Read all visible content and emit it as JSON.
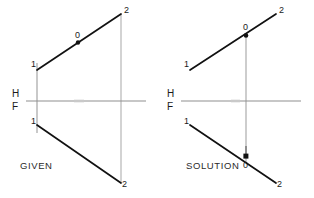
{
  "figure": {
    "background_color": "#ffffff",
    "line_color": "#111111",
    "projector_color": "#b4b4b4",
    "reference_line_color": "#8a8a8a",
    "width": 314,
    "height": 198
  },
  "captions": {
    "given": "GIVEN",
    "solution": "SOLUTION",
    "footer": ""
  },
  "reference_lines": {
    "given": {
      "upper_label": "H",
      "lower_label": "F",
      "y": 101,
      "x_start": 26,
      "x_end": 146
    },
    "solution": {
      "upper_label": "H",
      "lower_label": "F",
      "y": 101,
      "x_start": 181,
      "x_end": 301
    }
  },
  "views": {
    "given": {
      "name": "GIVEN",
      "top_view": {
        "name": "top-view",
        "line": {
          "x1": 37,
          "y1": 70,
          "x2": 121,
          "y2": 14
        },
        "endpoints": [
          {
            "label": "1",
            "x": 37,
            "y": 70
          },
          {
            "label": "2",
            "x": 121,
            "y": 14
          }
        ],
        "points": [
          {
            "label": "0",
            "x": 78,
            "y": 42,
            "marked": true
          }
        ]
      },
      "front_view": {
        "name": "front-view",
        "line": {
          "x1": 37,
          "y1": 125,
          "x2": 121,
          "y2": 183
        },
        "endpoints": [
          {
            "label": "1",
            "x": 37,
            "y": 125
          },
          {
            "label": "2",
            "x": 121,
            "y": 183
          }
        ],
        "points": []
      },
      "projectors": [
        {
          "label": "projector-1",
          "x": 37,
          "y1": 63,
          "y2": 133
        },
        {
          "label": "projector-2",
          "x": 121,
          "y1": 14,
          "y2": 183
        }
      ]
    },
    "solution": {
      "name": "SOLUTION",
      "top_view": {
        "name": "top-view",
        "line": {
          "x1": 190,
          "y1": 70,
          "x2": 276,
          "y2": 14
        },
        "endpoints": [
          {
            "label": "1",
            "x": 190,
            "y": 70
          },
          {
            "label": "2",
            "x": 276,
            "y": 14
          }
        ],
        "points": [
          {
            "label": "0",
            "x": 246,
            "y": 35,
            "marked": true
          }
        ]
      },
      "front_view": {
        "name": "front-view",
        "line": {
          "x1": 190,
          "y1": 125,
          "x2": 276,
          "y2": 183
        },
        "endpoints": [
          {
            "label": "1",
            "x": 190,
            "y": 125
          },
          {
            "label": "2",
            "x": 276,
            "y": 183
          }
        ],
        "points": [
          {
            "label": "0",
            "x": 246,
            "y": 163,
            "marked": true
          }
        ]
      },
      "projectors": [
        {
          "label": "projector-0",
          "x": 246,
          "y1": 35,
          "y2": 163
        }
      ]
    }
  },
  "point_labels": {
    "one": "1",
    "two": "2",
    "zero": "0"
  }
}
